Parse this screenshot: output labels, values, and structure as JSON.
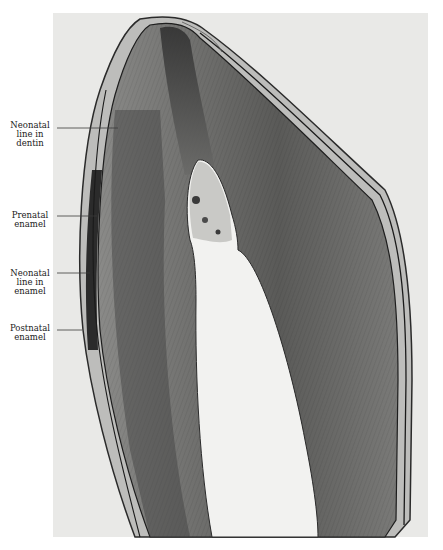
{
  "figure": {
    "labels": [
      {
        "id": "neonatal-line-dentin",
        "lines": [
          "Neonatal",
          "line in",
          "dentin"
        ]
      },
      {
        "id": "prenatal-enamel",
        "lines": [
          "Prenatal",
          "enamel"
        ]
      },
      {
        "id": "neonatal-line-enamel",
        "lines": [
          "Neonatal",
          "line in",
          "enamel"
        ]
      },
      {
        "id": "postnatal-enamel",
        "lines": [
          "Postnatal",
          "enamel"
        ]
      }
    ]
  },
  "colors": {
    "background": "#ffffff",
    "frame": "#e9e9e7",
    "tissue_dark": "#3c3c3c",
    "tissue_mid": "#8a8a88",
    "pulp": "#f2f2f0"
  }
}
